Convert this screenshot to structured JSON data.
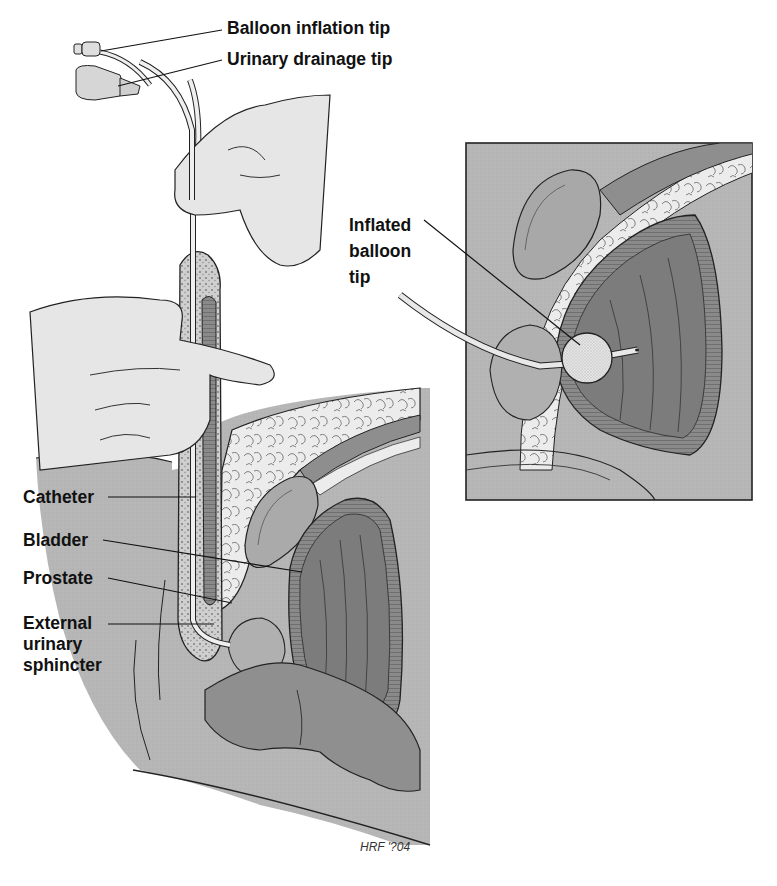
{
  "figure": {
    "type": "medical illustration",
    "colors": {
      "background": "#ffffff",
      "body_gray": "#b4b4b4",
      "skin_light": "#e6e6e6",
      "organ_mid": "#9a9a9a",
      "bladder_dark": "#7c7c7c",
      "fat_light": "#ececec",
      "outline": "#222222",
      "catheter": "#efefef"
    }
  },
  "labels": {
    "balloon_inflation_tip": "Balloon inflation tip",
    "urinary_drainage_tip": "Urinary drainage tip",
    "catheter": "Catheter",
    "bladder": "Bladder",
    "prostate": "Prostate",
    "external_urinary_sphincter": [
      "External",
      "urinary",
      "sphincter"
    ],
    "inflated_balloon_tip": [
      "Inflated",
      "balloon",
      "tip"
    ]
  },
  "inset": {
    "title": "Inflated balloon tip detail",
    "frame": {
      "x": 466,
      "y": 143,
      "width": 286,
      "height": 357
    }
  },
  "signature": "HRF '?04"
}
